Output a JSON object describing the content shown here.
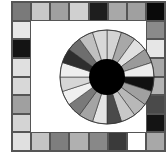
{
  "board": {
    "grid_size": 8,
    "top_row": [
      {
        "color": "#7a7a7a"
      },
      {
        "color": "#c8c8c8"
      },
      {
        "color": "#a0a0a0"
      },
      {
        "color": "#d0d0d0"
      },
      {
        "color": "#1e1e1e"
      },
      {
        "color": "#a8a8a8"
      },
      {
        "color": "#a0a0a0"
      },
      {
        "color": "#0a0a0a"
      }
    ],
    "right_column": [
      {
        "color": "#8a8a8a"
      },
      {
        "color": "#e6e6e6"
      },
      {
        "color": "#a8a8a8"
      },
      {
        "color": "#b4b4b4"
      },
      {
        "color": "#4a4a4a"
      },
      {
        "color": "#141414"
      }
    ],
    "bottom_row": [
      {
        "color": "#e0e0e0"
      },
      {
        "color": "#c4c4c4"
      },
      {
        "color": "#7e7e7e"
      },
      {
        "color": "#b0b0b0"
      },
      {
        "color": "#888888"
      },
      {
        "color": "#3a3a3a"
      },
      {
        "color": "#ffffff"
      },
      {
        "color": "#a8a8a8"
      }
    ],
    "left_column": [
      {
        "color": "#e6e6e6"
      },
      {
        "color": "#141414"
      },
      {
        "color": "#e0e0e0"
      },
      {
        "color": "#d8d8d8"
      },
      {
        "color": "#a0a0a0"
      },
      {
        "color": "#d4d4d4"
      }
    ]
  },
  "wheel": {
    "segment_count": 20,
    "hub_color": "#000000",
    "segments": [
      "#d4d4d4",
      "#a8a8a8",
      "#e0e0e0",
      "#9a9a9a",
      "#ececec",
      "#111111",
      "#a0a0a0",
      "#b8b8b8",
      "#c8c8c8",
      "#4a4a4a",
      "#e4e4e4",
      "#a4a4a4",
      "#7a7a7a",
      "#f0f0f0",
      "#d6d6d6",
      "#eeeeee",
      "#2e2e2e",
      "#6e6e6e",
      "#c0c0c0",
      "#d8d8d8"
    ]
  }
}
